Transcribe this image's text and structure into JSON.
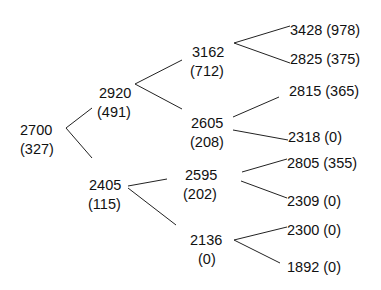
{
  "tree": {
    "nodes": {
      "root": {
        "value": "2700",
        "sub": "(327)"
      },
      "u": {
        "value": "2920",
        "sub": "(491)"
      },
      "d": {
        "value": "2405",
        "sub": "(115)"
      },
      "uu": {
        "value": "3162",
        "sub": "(712)"
      },
      "ud": {
        "value": "2605",
        "sub": "(208)"
      },
      "du": {
        "value": "2595",
        "sub": "(202)"
      },
      "dd": {
        "value": "2136",
        "sub": "(0)"
      },
      "uuu": {
        "label": "3428 (978)"
      },
      "uud": {
        "label": "2825 (375)"
      },
      "udu": {
        "label": "2815 (365)"
      },
      "udd": {
        "label": "2318 (0)"
      },
      "duu": {
        "label": "2805 (355)"
      },
      "dud": {
        "label": "2309 (0)"
      },
      "ddu": {
        "label": "2300 (0)"
      },
      "ddd": {
        "label": "1892 (0)"
      }
    }
  }
}
